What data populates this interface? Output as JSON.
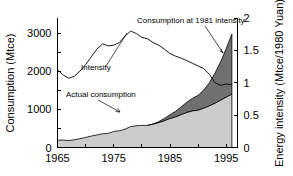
{
  "chart_data": {
    "type": "area",
    "title": "",
    "xlabel": "",
    "ylabel": "Consumption (Mtce)",
    "y2label": "Energy intensity (Mtce/1980 Yuan)",
    "xlim": [
      1965,
      1997
    ],
    "ylim": [
      0,
      3400
    ],
    "y2lim": [
      0,
      2.0
    ],
    "grid": false,
    "legend_position": "none",
    "x_ticks": [
      1965,
      1970,
      1975,
      1980,
      1985,
      1990,
      1995
    ],
    "x_tick_labels": [
      "1965",
      "",
      "1975",
      "",
      "1985",
      "",
      "1995"
    ],
    "y_ticks": [
      0,
      500,
      1000,
      1500,
      2000,
      2500,
      3000
    ],
    "y_tick_labels": [
      "0",
      "",
      "1000",
      "",
      "2000",
      "",
      "3000"
    ],
    "y2_ticks": [
      0,
      0.5,
      1,
      1.5,
      2
    ],
    "y2_tick_labels": [
      "0",
      "0.5",
      "1",
      "1.5",
      "2"
    ],
    "annotations": [
      {
        "text": "Consumption at 1981 intensity",
        "x": 1983,
        "y": 3250
      },
      {
        "text": "Intensity",
        "x": 1971,
        "y": 1750
      },
      {
        "text": "Actual consumption",
        "x": 1967,
        "y": 1100
      }
    ],
    "series": [
      {
        "name": "Actual consumption",
        "type": "area",
        "axis": "left",
        "unit": "Mtce",
        "color": "#cccccc",
        "x": [
          1965,
          1966,
          1967,
          1968,
          1969,
          1970,
          1971,
          1972,
          1973,
          1974,
          1975,
          1976,
          1977,
          1978,
          1979,
          1980,
          1981,
          1982,
          1983,
          1984,
          1985,
          1986,
          1987,
          1988,
          1989,
          1990,
          1991,
          1992,
          1993,
          1994,
          1995,
          1996
        ],
        "values": [
          190,
          195,
          180,
          205,
          230,
          265,
          300,
          330,
          360,
          370,
          420,
          440,
          480,
          550,
          570,
          580,
          580,
          610,
          650,
          700,
          760,
          800,
          860,
          920,
          960,
          980,
          1030,
          1090,
          1160,
          1240,
          1320,
          1400
        ]
      },
      {
        "name": "Consumption at 1981 intensity",
        "type": "area",
        "axis": "left",
        "unit": "Mtce",
        "color": "#707070",
        "x": [
          1981,
          1982,
          1983,
          1984,
          1985,
          1986,
          1987,
          1988,
          1989,
          1990,
          1991,
          1992,
          1993,
          1994,
          1995,
          1996
        ],
        "values": [
          580,
          620,
          680,
          760,
          860,
          950,
          1070,
          1190,
          1290,
          1370,
          1510,
          1700,
          1950,
          2250,
          2600,
          2980
        ]
      },
      {
        "name": "Intensity",
        "type": "line",
        "axis": "right",
        "unit": "Mtce/1980 Yuan",
        "color": "#000000",
        "x": [
          1965,
          1966,
          1967,
          1968,
          1969,
          1970,
          1971,
          1972,
          1973,
          1974,
          1975,
          1976,
          1977,
          1978,
          1979,
          1980,
          1981,
          1982,
          1983,
          1984,
          1985,
          1986,
          1987,
          1988,
          1989,
          1990,
          1991,
          1992,
          1993,
          1994,
          1995,
          1996
        ],
        "values": [
          1.2,
          1.12,
          1.07,
          1.1,
          1.18,
          1.28,
          1.4,
          1.52,
          1.6,
          1.57,
          1.58,
          1.62,
          1.72,
          1.8,
          1.76,
          1.7,
          1.68,
          1.62,
          1.58,
          1.52,
          1.45,
          1.41,
          1.38,
          1.34,
          1.3,
          1.26,
          1.22,
          1.13,
          1.0,
          0.96,
          0.98,
          0.97
        ]
      }
    ]
  }
}
